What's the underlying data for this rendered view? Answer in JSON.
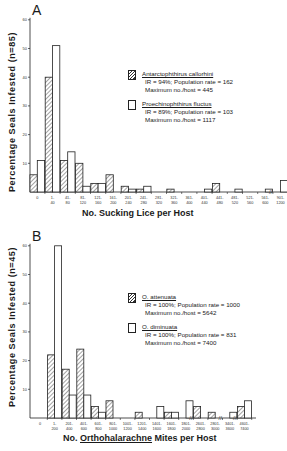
{
  "chart_data": [
    {
      "panel": "A",
      "type": "bar",
      "xlabel": "No. Sucking Lice per Host",
      "ylabel": "Percentage Seals Infested (n=85)",
      "ylim": [
        0,
        60
      ],
      "yticks": [
        10,
        20,
        30,
        40,
        50,
        60
      ],
      "categories": [
        "0",
        "1-40",
        "41-80",
        "81-120",
        "121-160",
        "161-200",
        "201-240",
        "241-280",
        "281-320",
        "321-360",
        "361-400",
        "401-440",
        "441-480",
        "481-520",
        "521-560",
        "561-600",
        "901-1200"
      ],
      "series": [
        {
          "name": "Antarctophthirus callorhini",
          "pattern": "hatched",
          "values": [
            6,
            40,
            11,
            10,
            3,
            6,
            2,
            1,
            0,
            1,
            0,
            0,
            3,
            0,
            0,
            0,
            0
          ],
          "legend_lines": [
            "IR = 94%; Population rate = 162",
            "Maximum no./host = 445"
          ]
        },
        {
          "name": "Proechinophthirus fluctus",
          "pattern": "open",
          "values": [
            11,
            51,
            14,
            2,
            3,
            0,
            1,
            2,
            0,
            0,
            0,
            1,
            0,
            1,
            0,
            1,
            4
          ],
          "legend_lines": [
            "IR = 89%; Population rate = 103",
            "Maximum no./host = 1117"
          ]
        }
      ],
      "axis_break_before": "901-1200"
    },
    {
      "panel": "B",
      "type": "bar",
      "xlabel": "No. Orthohalarachne Mites per Host",
      "ylabel": "Percentage Seals Infested (n=45)",
      "ylim": [
        0,
        60
      ],
      "yticks": [
        10,
        20,
        30,
        40,
        50,
        60
      ],
      "categories": [
        "0",
        "1-200",
        "201-400",
        "401-600",
        "601-800",
        "801-1000",
        "1001-1200",
        "1201-1400",
        "1401-1600",
        "1601-1800",
        "1801-2000",
        "2601-2800",
        "2801-3000",
        "3401-3600",
        "4601-7400"
      ],
      "series": [
        {
          "name": "O. attenuata",
          "pattern": "hatched",
          "values": [
            0,
            22,
            17,
            24,
            4,
            6,
            0,
            2,
            0,
            2,
            0,
            4,
            2,
            0,
            4
          ],
          "legend_lines": [
            "IR = 100%; Population rate = 1000",
            "Maximum no./host = 5642"
          ]
        },
        {
          "name": "O. diminuata",
          "pattern": "open",
          "values": [
            0,
            60,
            8,
            8,
            2,
            0,
            0,
            0,
            4,
            2,
            6,
            0,
            0,
            2,
            6
          ],
          "legend_lines": [
            "IR = 100%; Population rate = 831",
            "Maximum no./host = 7400"
          ]
        }
      ],
      "axis_breaks_before": [
        "2601-2800",
        "3401-3600",
        "4601-7400"
      ]
    }
  ],
  "panel_a": {
    "label": "A",
    "ylabel": "Percentage Seals Infested (n=85)",
    "xlabel": "No. Sucking Lice per Host",
    "legend": [
      {
        "species": "Antarctophthirus callorhini",
        "line1": "IR = 94%; Population rate = 162",
        "line2": "Maximum no./host = 445"
      },
      {
        "species": "Proechinophthirus fluctus",
        "line1": "IR = 89%; Population rate = 103",
        "line2": "Maximum no./host = 1117"
      }
    ]
  },
  "panel_b": {
    "label": "B",
    "ylabel": "Percentage Seals Infested (n=45)",
    "xlabel_pre": "No. ",
    "xlabel_genus": "Orthohalarachne",
    "xlabel_post": " Mites per Host",
    "legend": [
      {
        "species": "O. attenuata",
        "line1": "IR = 100%; Population rate = 1000",
        "line2": "Maximum no./host = 5642"
      },
      {
        "species": "O. diminuata",
        "line1": "IR = 100%; Population rate = 831",
        "line2": "Maximum no./host = 7400"
      }
    ]
  }
}
